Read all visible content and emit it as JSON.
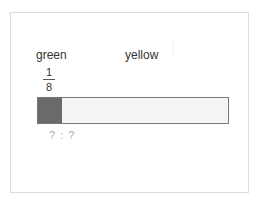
{
  "labels": {
    "left": "green",
    "right": "yellow"
  },
  "fraction": {
    "numerator": "1",
    "denominator": "8"
  },
  "tape": {
    "segments_total": 8,
    "segments_filled": 1,
    "filled_color": "#6a6a6a",
    "empty_color": "#f5f5f5",
    "border_color": "#777777"
  },
  "ratio": {
    "text": "? : ?"
  }
}
